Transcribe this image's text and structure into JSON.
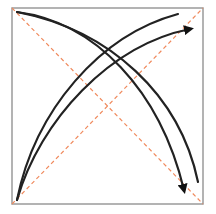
{
  "diagram": {
    "frame": {
      "x1": 12,
      "y1": 8,
      "x2": 203,
      "y2": 204,
      "color": "#9a9a9a"
    },
    "diagonals": {
      "color": "#f08a5d",
      "dash": "4 3",
      "lines": [
        {
          "name": "diagonal-tl-br",
          "x1": 12,
          "y1": 8,
          "x2": 203,
          "y2": 204
        },
        {
          "name": "diagonal-bl-tr",
          "x1": 12,
          "y1": 204,
          "x2": 203,
          "y2": 8
        }
      ]
    },
    "curves": {
      "color": "#222222",
      "items": [
        {
          "name": "curve-tl-br-arrow",
          "d": "M17,12 C95,22 160,90 184,190",
          "arrow": true
        },
        {
          "name": "curve-tl-br-plain",
          "d": "M17,12 C110,30 180,95 198,182",
          "arrow": false
        },
        {
          "name": "curve-bl-tr-plain",
          "d": "M17,200 C35,110 100,35 178,14",
          "arrow": false
        },
        {
          "name": "curve-bl-tr-arrow",
          "d": "M17,200 C40,120 110,45 190,29",
          "arrow": true
        }
      ]
    }
  }
}
